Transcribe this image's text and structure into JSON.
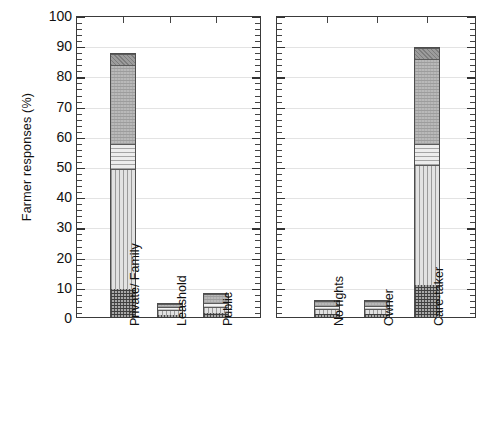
{
  "chart_data": {
    "type": "bar",
    "subtype": "stacked-bar",
    "title": "",
    "xlabel": "",
    "ylabel": "Farmer responses (%)",
    "ylim": [
      0,
      100
    ],
    "ytick_labels": [
      "0",
      "10",
      "20",
      "30",
      "40",
      "50",
      "60",
      "70",
      "80",
      "90",
      "100"
    ],
    "ytick_values": [
      0,
      10,
      20,
      30,
      40,
      50,
      60,
      70,
      80,
      90,
      100
    ],
    "ytick_interval": 10,
    "minor_ticks": true,
    "grid": true,
    "legend": "none",
    "panels": [
      {
        "name": "land-tenure",
        "categories": [
          "Private/ Family",
          "Leashold",
          "Public"
        ],
        "totals": [
          87.5,
          4.7,
          8.0
        ],
        "bars": [
          {
            "category": "Private/ Family",
            "total": 87.5,
            "segments": [
              {
                "fill": "f-cross",
                "from": 0.0,
                "to": 9.5
              },
              {
                "fill": "f-vert",
                "from": 9.5,
                "to": 49.5
              },
              {
                "fill": "f-horz",
                "from": 49.5,
                "to": 57.5
              },
              {
                "fill": "f-dots",
                "from": 57.5,
                "to": 83.8
              },
              {
                "fill": "f-dark",
                "from": 83.8,
                "to": 87.5
              }
            ]
          },
          {
            "category": "Leashold",
            "total": 4.7,
            "segments": [
              {
                "fill": "f-cross",
                "from": 0.0,
                "to": 1.0
              },
              {
                "fill": "f-vert",
                "from": 1.0,
                "to": 2.6
              },
              {
                "fill": "f-light",
                "from": 2.6,
                "to": 3.6
              },
              {
                "fill": "f-dots",
                "from": 3.6,
                "to": 4.7
              }
            ]
          },
          {
            "category": "Public",
            "total": 8.0,
            "segments": [
              {
                "fill": "f-cross",
                "from": 0.0,
                "to": 1.6
              },
              {
                "fill": "f-vert",
                "from": 1.6,
                "to": 3.6
              },
              {
                "fill": "f-light",
                "from": 3.6,
                "to": 5.0
              },
              {
                "fill": "f-dots",
                "from": 5.0,
                "to": 8.0
              }
            ]
          }
        ]
      },
      {
        "name": "tree-rights",
        "categories": [
          "No rights",
          "Owner",
          "Care-taker"
        ],
        "totals": [
          5.7,
          5.7,
          89.5
        ],
        "bars": [
          {
            "category": "No rights",
            "total": 5.7,
            "segments": [
              {
                "fill": "f-cross",
                "from": 0.0,
                "to": 1.3
              },
              {
                "fill": "f-vert",
                "from": 1.3,
                "to": 2.9
              },
              {
                "fill": "f-light",
                "from": 2.9,
                "to": 4.0
              },
              {
                "fill": "f-dots",
                "from": 4.0,
                "to": 5.7
              }
            ]
          },
          {
            "category": "Owner",
            "total": 5.7,
            "segments": [
              {
                "fill": "f-cross",
                "from": 0.0,
                "to": 1.3
              },
              {
                "fill": "f-vert",
                "from": 1.3,
                "to": 2.9
              },
              {
                "fill": "f-light",
                "from": 2.9,
                "to": 4.0
              },
              {
                "fill": "f-dots",
                "from": 4.0,
                "to": 5.7
              }
            ]
          },
          {
            "category": "Care-taker",
            "total": 89.5,
            "segments": [
              {
                "fill": "f-cross",
                "from": 0.0,
                "to": 11.0
              },
              {
                "fill": "f-vert",
                "from": 11.0,
                "to": 50.5
              },
              {
                "fill": "f-horz",
                "from": 50.5,
                "to": 57.5
              },
              {
                "fill": "f-dots",
                "from": 57.5,
                "to": 85.8
              },
              {
                "fill": "f-dark",
                "from": 85.8,
                "to": 89.5
              }
            ]
          }
        ]
      }
    ]
  }
}
